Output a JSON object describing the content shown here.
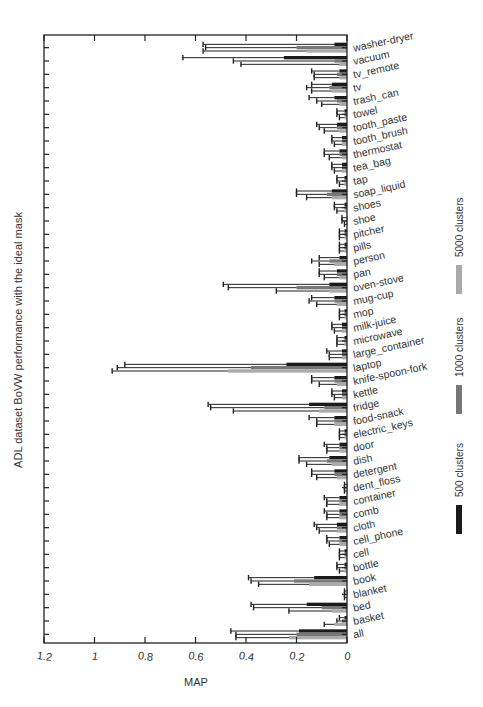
{
  "chart_data": {
    "type": "bar",
    "orientation": "horizontal",
    "x_direction": "reversed",
    "title": "ADL dataset BoVW performance with the ideal mask",
    "xlabel": "MAP",
    "ylabel": "",
    "xlim": [
      0,
      1.2
    ],
    "x_ticks": [
      "1.2",
      "1",
      "0.8",
      "0.6",
      "0.4",
      "0.2",
      "0"
    ],
    "x_tick_values": [
      1.2,
      1.0,
      0.8,
      0.6,
      0.4,
      0.2,
      0
    ],
    "grid": false,
    "legend_position": "right",
    "categories": [
      "washer-dryer",
      "vacuum",
      "tv_remote",
      "tv",
      "trash_can",
      "towel",
      "tooth_paste",
      "tooth_brush",
      "thermostat",
      "tea_bag",
      "tap",
      "soap_liquid",
      "shoes",
      "shoe",
      "pitcher",
      "pills",
      "person",
      "pan",
      "oven-stove",
      "mug-cup",
      "mop",
      "milk-juice",
      "microwave",
      "large_container",
      "laptop",
      "knife-spoon-fork",
      "kettle",
      "fridge",
      "food-snack",
      "electric_keys",
      "door",
      "dish",
      "detergent",
      "dent_floss",
      "container",
      "comb",
      "cloth",
      "cell_phone",
      "cell",
      "bottle",
      "book",
      "blanket",
      "bed",
      "basket",
      "all"
    ],
    "series": [
      {
        "name": "500 clusters",
        "color": "#1a1a1a",
        "values": [
          0.05,
          0.25,
          0.03,
          0.06,
          0.05,
          0.01,
          0.04,
          0.02,
          0.03,
          0.02,
          0.01,
          0.06,
          0.01,
          0.0,
          0.01,
          0.01,
          0.03,
          0.04,
          0.07,
          0.05,
          0.01,
          0.02,
          0.01,
          0.02,
          0.24,
          0.05,
          0.02,
          0.15,
          0.05,
          0.01,
          0.03,
          0.07,
          0.05,
          0.0,
          0.03,
          0.03,
          0.04,
          0.03,
          0.01,
          0.01,
          0.13,
          0.0,
          0.16,
          0.01,
          0.19
        ],
        "errors": [
          0.52,
          0.4,
          0.11,
          0.08,
          0.1,
          0.03,
          0.08,
          0.04,
          0.06,
          0.04,
          0.03,
          0.14,
          0.04,
          0.02,
          0.02,
          0.02,
          0.08,
          0.07,
          0.42,
          0.09,
          0.02,
          0.04,
          0.03,
          0.06,
          0.64,
          0.09,
          0.04,
          0.4,
          0.1,
          0.02,
          0.06,
          0.12,
          0.09,
          0.01,
          0.06,
          0.06,
          0.09,
          0.05,
          0.02,
          0.03,
          0.26,
          0.01,
          0.22,
          0.02,
          0.27
        ]
      },
      {
        "name": "1000 clusters",
        "color": "#777777",
        "values": [
          0.2,
          0.05,
          0.04,
          0.07,
          0.04,
          0.01,
          0.04,
          0.02,
          0.03,
          0.02,
          0.01,
          0.08,
          0.01,
          0.0,
          0.01,
          0.01,
          0.07,
          0.04,
          0.2,
          0.05,
          0.01,
          0.02,
          0.01,
          0.02,
          0.38,
          0.05,
          0.02,
          0.09,
          0.05,
          0.01,
          0.03,
          0.08,
          0.05,
          0.0,
          0.03,
          0.03,
          0.04,
          0.03,
          0.01,
          0.01,
          0.21,
          0.0,
          0.1,
          0.02,
          0.2
        ],
        "errors": [
          0.36,
          0.4,
          0.09,
          0.09,
          0.08,
          0.03,
          0.07,
          0.04,
          0.06,
          0.04,
          0.03,
          0.12,
          0.04,
          0.02,
          0.02,
          0.02,
          0.07,
          0.07,
          0.27,
          0.1,
          0.02,
          0.04,
          0.03,
          0.05,
          0.53,
          0.09,
          0.04,
          0.45,
          0.07,
          0.02,
          0.05,
          0.11,
          0.09,
          0.01,
          0.05,
          0.05,
          0.08,
          0.05,
          0.02,
          0.03,
          0.17,
          0.01,
          0.27,
          0.02,
          0.24
        ]
      },
      {
        "name": "5000 clusters",
        "color": "#aaaaaa",
        "values": [
          0.16,
          0.03,
          0.03,
          0.06,
          0.03,
          0.01,
          0.03,
          0.02,
          0.02,
          0.02,
          0.01,
          0.06,
          0.01,
          0.0,
          0.01,
          0.01,
          0.05,
          0.03,
          0.07,
          0.04,
          0.01,
          0.02,
          0.01,
          0.02,
          0.47,
          0.04,
          0.02,
          0.11,
          0.05,
          0.01,
          0.03,
          0.06,
          0.04,
          0.0,
          0.03,
          0.03,
          0.04,
          0.03,
          0.01,
          0.01,
          0.15,
          0.0,
          0.06,
          0.05,
          0.23
        ],
        "errors": [
          0.41,
          0.39,
          0.1,
          0.08,
          0.07,
          0.02,
          0.06,
          0.03,
          0.05,
          0.03,
          0.02,
          0.1,
          0.03,
          0.01,
          0.02,
          0.02,
          0.06,
          0.06,
          0.21,
          0.08,
          0.02,
          0.03,
          0.03,
          0.05,
          0.46,
          0.07,
          0.03,
          0.34,
          0.07,
          0.02,
          0.05,
          0.1,
          0.08,
          0.01,
          0.05,
          0.05,
          0.07,
          0.04,
          0.02,
          0.02,
          0.2,
          0.01,
          0.17,
          0.04,
          0.21
        ]
      }
    ]
  }
}
